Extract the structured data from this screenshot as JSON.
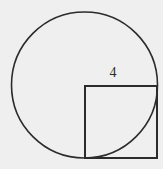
{
  "figure": {
    "kind": "geometry-diagram",
    "background_color": "#efefef",
    "stroke_color": "#2b2b2b",
    "canvas": {
      "width": 163,
      "height": 169
    },
    "labels": [
      {
        "id": "side-4",
        "text": "4",
        "x": 113,
        "y": 74,
        "color": "#2b2b2b",
        "font_size": 14,
        "refers_to": "square-side-length"
      }
    ],
    "shapes": [
      {
        "id": "circle",
        "type": "circle",
        "cx": 84.5,
        "cy": 85,
        "r": 73,
        "fill": "none",
        "stroke": "#2b2b2b",
        "stroke_width": 1.6
      },
      {
        "id": "square",
        "type": "rect",
        "x": 85,
        "y": 86,
        "width": 72,
        "height": 72,
        "fill": "none",
        "stroke": "#2b2b2b",
        "stroke_width": 1.8
      }
    ]
  },
  "chart_data": {
    "type": "diagram",
    "title": "",
    "subtitle": "",
    "xlabel": "",
    "ylabel": "",
    "annotations": [
      "4"
    ],
    "elements": [
      {
        "shape": "circle",
        "center": [
          84.5,
          85
        ],
        "radius": 73
      },
      {
        "shape": "square",
        "top_left": [
          85,
          86
        ],
        "side": 72,
        "labeled_side": "4"
      }
    ]
  }
}
